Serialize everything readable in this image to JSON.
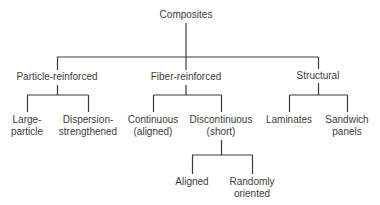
{
  "diagram": {
    "type": "tree",
    "root": {
      "id": "composites",
      "label": "Composites",
      "x": 186,
      "y": 9
    },
    "nodes": [
      {
        "id": "particle",
        "label": "Particle-reinforced",
        "x": 57,
        "y": 72,
        "parent": "composites"
      },
      {
        "id": "fiber",
        "label": "Fiber-reinforced",
        "x": 186,
        "y": 72,
        "parent": "composites"
      },
      {
        "id": "structural",
        "label": "Structural",
        "x": 318,
        "y": 71,
        "parent": "composites"
      },
      {
        "id": "large_particle",
        "label_lines": [
          "Large-",
          "particle"
        ],
        "x": 27,
        "y": 115,
        "parent": "particle"
      },
      {
        "id": "dispersion",
        "label_lines": [
          "Dispersion-",
          "strengthened"
        ],
        "x": 88,
        "y": 115,
        "parent": "particle"
      },
      {
        "id": "continuous",
        "label_lines": [
          "Continuous",
          "(aligned)"
        ],
        "x": 153,
        "y": 115,
        "parent": "fiber"
      },
      {
        "id": "discontinuous",
        "label_lines": [
          "Discontinuous",
          "(short)"
        ],
        "x": 221,
        "y": 115,
        "parent": "fiber"
      },
      {
        "id": "laminates",
        "label_lines": [
          "Laminates"
        ],
        "x": 289,
        "y": 115,
        "parent": "structural"
      },
      {
        "id": "sandwich",
        "label_lines": [
          "Sandwich",
          "panels"
        ],
        "x": 347,
        "y": 115,
        "parent": "structural"
      },
      {
        "id": "aligned",
        "label_lines": [
          "Aligned"
        ],
        "x": 192,
        "y": 177,
        "parent": "discontinuous"
      },
      {
        "id": "random",
        "label_lines": [
          "Randomly",
          "oriented"
        ],
        "x": 252,
        "y": 177,
        "parent": "discontinuous"
      }
    ],
    "line_color": "#3a3a3a"
  },
  "labels": {
    "composites": "Composites",
    "particle": "Particle-reinforced",
    "fiber": "Fiber-reinforced",
    "structural": "Structural",
    "large_particle_1": "Large-",
    "large_particle_2": "particle",
    "dispersion_1": "Dispersion-",
    "dispersion_2": "strengthened",
    "continuous_1": "Continuous",
    "continuous_2": "(aligned)",
    "discontinuous_1": "Discontinuous",
    "discontinuous_2": "(short)",
    "laminates": "Laminates",
    "sandwich_1": "Sandwich",
    "sandwich_2": "panels",
    "aligned": "Aligned",
    "random_1": "Randomly",
    "random_2": "oriented"
  }
}
